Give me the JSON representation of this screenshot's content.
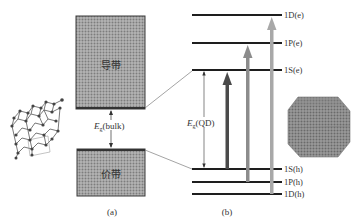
{
  "panel_a": {
    "caption": "(a)",
    "conduction_band_label": "导带",
    "valence_band_label": "价带",
    "gap_label_main": "E",
    "gap_label_sub": "g",
    "gap_label_suffix": "(bulk)",
    "illustration": "bulk-crystal-lattice"
  },
  "panel_b": {
    "caption": "(b)",
    "gap_label_main": "E",
    "gap_label_sub": "g",
    "gap_label_suffix": "(QD)",
    "levels": [
      {
        "label": "1D(e)",
        "y": 15
      },
      {
        "label": "1P(e)",
        "y": 43
      },
      {
        "label": "1S(e)",
        "y": 70
      },
      {
        "label": "1S(h)",
        "y": 169
      },
      {
        "label": "1P(h)",
        "y": 182
      },
      {
        "label": "1D(h)",
        "y": 194
      }
    ],
    "transitions": [
      {
        "from": "1S(h)",
        "to": "1S(e)",
        "color": "#4a4a4a"
      },
      {
        "from": "1P(h)",
        "to": "1P(e)",
        "color": "#8c8c8c"
      },
      {
        "from": "1D(h)",
        "to": "1D(e)",
        "color": "#a8a8a8"
      }
    ],
    "illustration": "quantum-dot-nanocrystal"
  },
  "colors": {
    "band_fill": "#a9a9a9",
    "band_edge": "#3a3a3a",
    "level_line": "#1e1e1e"
  }
}
